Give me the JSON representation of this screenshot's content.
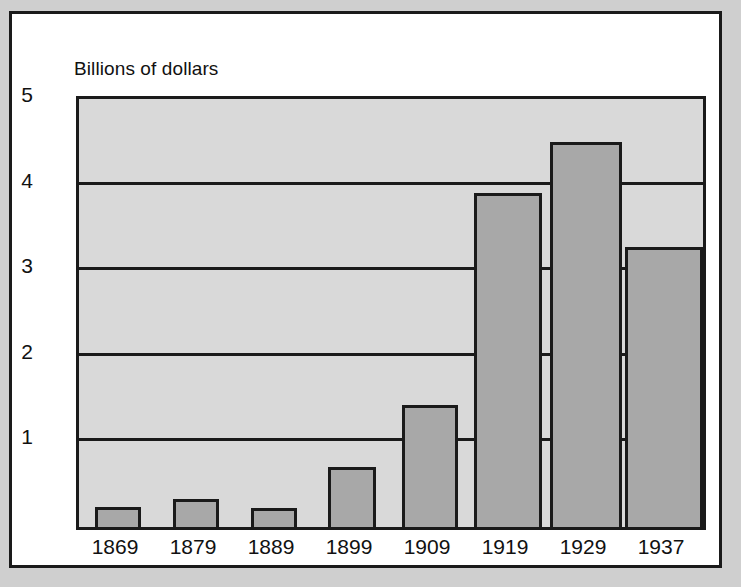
{
  "figure": {
    "axis_unit_label": "Billions of dollars",
    "colors": {
      "paper_margin": "#cfcfcf",
      "card_background": "#ffffff",
      "plot_background": "#d9d9d9",
      "bar_fill": "#a8a8a8",
      "ink": "#1a1a1a"
    }
  },
  "chart_data": {
    "type": "bar",
    "title": "",
    "subtitle": "",
    "xlabel": "",
    "ylabel": "Billions of dollars",
    "categories": [
      "1869",
      "1879",
      "1889",
      "1899",
      "1909",
      "1919",
      "1929",
      "1937"
    ],
    "values": [
      0.23,
      0.33,
      0.22,
      0.7,
      1.43,
      3.9,
      4.5,
      3.27
    ],
    "ylim": [
      0,
      5
    ],
    "ytick_labels": [
      "1",
      "2",
      "3",
      "4",
      "5"
    ],
    "ytick_values": [
      1,
      2,
      3,
      4,
      5
    ],
    "grid": "horizontal",
    "legend": "none",
    "annotations": []
  }
}
